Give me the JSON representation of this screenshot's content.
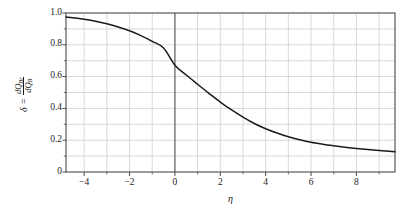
{
  "chart_data": {
    "type": "line",
    "title": "",
    "subtitle": "",
    "xlabel": "η",
    "ylabel_delta": "δ =",
    "ylabel_numerator": "dQ",
    "ylabel_numerator_sub": "Br",
    "ylabel_denominator": "dQ",
    "ylabel_denominator_sub": "B",
    "xlim": [
      -4.8,
      9.7
    ],
    "ylim": [
      0,
      1.0
    ],
    "xticks": [
      -4,
      -2,
      0,
      2,
      4,
      6,
      8
    ],
    "xtick_labels": [
      "−4",
      "−2",
      "0",
      "2",
      "4",
      "6",
      "8"
    ],
    "x_minor_step": 1,
    "yticks": [
      0,
      0.2,
      0.4,
      0.6,
      0.8,
      1.0
    ],
    "ytick_labels": [
      "0",
      "0.2",
      "0.4",
      "0.6",
      "0.8",
      "1.0"
    ],
    "y_minor_step": 0.1,
    "grid": true,
    "grid_color": "#c8c8c8",
    "axis_color": "#4a4a4a",
    "curve_color": "#1a1a1a",
    "legend": "none",
    "legend_position": "none",
    "annotations": [],
    "series": [
      {
        "name": "δ(η)",
        "x": [
          -4.8,
          -4.5,
          -4.0,
          -3.5,
          -3.0,
          -2.5,
          -2.0,
          -1.5,
          -1.0,
          -0.5,
          0.0,
          0.5,
          1.0,
          1.5,
          2.0,
          2.5,
          3.0,
          3.5,
          4.0,
          4.5,
          5.0,
          5.5,
          6.0,
          6.5,
          7.0,
          7.5,
          8.0,
          8.5,
          9.0,
          9.7
        ],
        "y": [
          0.975,
          0.97,
          0.96,
          0.948,
          0.932,
          0.912,
          0.888,
          0.858,
          0.822,
          0.78,
          0.672,
          0.61,
          0.552,
          0.495,
          0.44,
          0.39,
          0.345,
          0.305,
          0.272,
          0.245,
          0.222,
          0.203,
          0.187,
          0.175,
          0.165,
          0.156,
          0.148,
          0.141,
          0.135,
          0.128
        ]
      }
    ]
  },
  "plot": {
    "left": 66,
    "top": 13,
    "right": 395,
    "bottom": 172
  }
}
